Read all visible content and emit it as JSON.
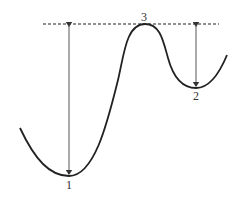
{
  "diagram": {
    "type": "potential-energy-curve",
    "labels": {
      "point1": "1",
      "point2": "2",
      "point3": "3"
    },
    "colors": {
      "curve": "#222222",
      "dashed_line": "#222222",
      "arrows": "#444444",
      "background": "#ffffff"
    },
    "points": [
      {
        "id": "1",
        "role": "global minimum",
        "x": 69,
        "y": 176
      },
      {
        "id": "2",
        "role": "local minimum",
        "x": 196,
        "y": 88
      },
      {
        "id": "3",
        "role": "maximum / barrier top",
        "x": 145,
        "y": 24
      }
    ],
    "reference_line": {
      "style": "dashed",
      "y": 24,
      "x_start": 43,
      "x_end": 219
    },
    "arrows": [
      {
        "from_level": "3",
        "to_point": "1",
        "x": 69,
        "direction": "double-headed"
      },
      {
        "from_level": "3",
        "to_point": "2",
        "x": 196,
        "direction": "double-headed"
      }
    ]
  }
}
